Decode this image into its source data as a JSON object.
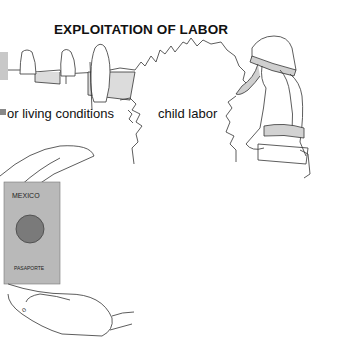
{
  "title": "EXPLOITATION OF LABOR",
  "labels": {
    "left": "or living conditions",
    "right": "child labor"
  },
  "passport": {
    "country": "MEXICO",
    "word": "PASAPORTE"
  },
  "colors": {
    "line": "#333333",
    "shade": "#d6d6d6",
    "passport": "#b9b9b9",
    "seal": "#7a7a7a"
  }
}
